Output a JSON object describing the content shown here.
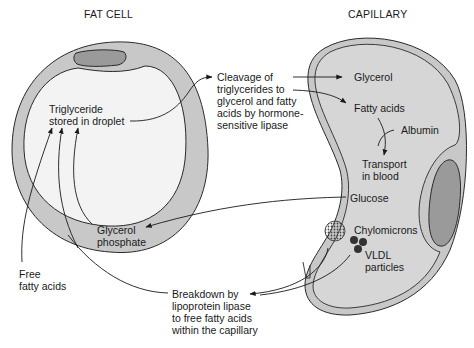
{
  "titles": {
    "fat_cell": "FAT CELL",
    "capillary": "CAPILLARY"
  },
  "labels": {
    "triglyceride": "Triglyceride\nstored in droplet",
    "cleavage": "Cleavage of\ntriglycerides to\nglycerol and fatty\nacids by hormone-\nsensitive lipase",
    "glycerol": "Glycerol",
    "fatty_acids": "Fatty acids",
    "albumin": "Albumin",
    "transport": "Transport\nin blood",
    "glucose": "Glucose",
    "glycerol_phosphate": "Glycerol\nphosphate",
    "chylomicrons": "Chylomicrons",
    "vldl": "VLDL\nparticles",
    "free_fatty_acids": "Free\nfatty acids",
    "breakdown": "Breakdown by\nlipoprotein lipase\nto free fatty acids\nwithin the capillary"
  },
  "colors": {
    "cell_wall": "#c8c8c8",
    "cell_inner": "#f2f2f2",
    "nucleus": "#9a9a9a",
    "capillary_fill": "#d4d4d4",
    "stroke": "#2a2a2a"
  }
}
